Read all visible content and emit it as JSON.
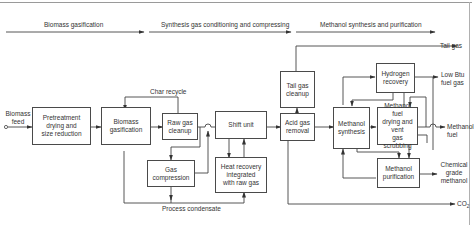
{
  "stages": [
    {
      "label": "Biomass gasification"
    },
    {
      "label": "Synthesis gas conditioning and compressing"
    },
    {
      "label": "Methanol synthesis and purification"
    }
  ],
  "inputs": {
    "biomass_feed": "Biomass\nfeed"
  },
  "units": {
    "pretreatment": "Pretreatment\ndrying and\nsize reduction",
    "biomass_gasification": "Biomass\ngasification",
    "raw_gas_cleanup": "Raw gas\ncleanup",
    "gas_compression": "Gas\ncompression",
    "shift_unit": "Shift unit",
    "heat_recovery": "Heat recovery\nintegrated\nwith raw gas",
    "tail_gas_cleanup": "Tail gas\ncleanup",
    "acid_gas_removal": "Acid gas\nremoval",
    "methanol_synthesis": "Methanol\nsynthesis",
    "hydrogen_recovery": "Hydrogen\nrecovery",
    "methanol_fuel_drying": "Methanol fuel\ndrying and vent\ngas scrubbing",
    "methanol_purification": "Methanol\npurification"
  },
  "streams": {
    "char_recycle": "Char recycle",
    "process_condensate": "Process condensate"
  },
  "outputs": {
    "tail_gas": "Tail gas",
    "low_btu": "Low Btu\nfuel gas",
    "methanol_fuel": "Methanol\nfuel",
    "chemical_methanol": "Chemical\ngrade\nmethanol",
    "co2": "CO",
    "co2_sub": "2"
  }
}
